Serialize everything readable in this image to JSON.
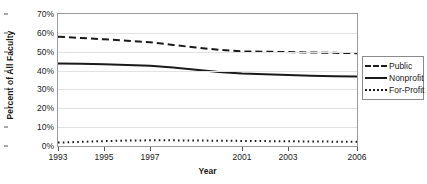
{
  "chart_data": {
    "type": "line",
    "title": "",
    "xlabel": "Year",
    "ylabel": "Percent of All Faculty",
    "xlim": [
      1993,
      2006
    ],
    "ylim": [
      0,
      70
    ],
    "grid": true,
    "legend_position": "right-outside",
    "x": [
      1993,
      1994,
      1995,
      1996,
      1997,
      1998,
      1999,
      2000,
      2001,
      2002,
      2003,
      2004,
      2005,
      2006
    ],
    "xtick_labels": [
      "1993",
      "1995",
      "1997",
      "2001",
      "2003",
      "2006"
    ],
    "xtick_values": [
      1993,
      1995,
      1997,
      2001,
      2003,
      2006
    ],
    "ytick_labels": [
      "0%",
      "10%",
      "20%",
      "30%",
      "40%",
      "50%",
      "60%",
      "70%"
    ],
    "ytick_values": [
      0,
      10,
      20,
      30,
      40,
      50,
      60,
      70
    ],
    "series": [
      {
        "name": "Public",
        "style": "dashed",
        "color": "#1a1a1a",
        "values": [
          58.0,
          57.3,
          56.6,
          55.8,
          55.0,
          53.6,
          52.2,
          51.0,
          50.2,
          50.0,
          49.8,
          49.6,
          49.4,
          49.2
        ]
      },
      {
        "name": "Nonprofit",
        "style": "solid",
        "color": "#1a1a1a",
        "values": [
          43.8,
          43.6,
          43.3,
          43.0,
          42.6,
          41.6,
          40.4,
          39.2,
          38.4,
          38.0,
          37.6,
          37.3,
          37.0,
          36.8
        ]
      },
      {
        "name": "For-Profit",
        "style": "dotted",
        "color": "#1a1a1a",
        "values": [
          1.8,
          2.2,
          2.6,
          2.9,
          3.0,
          3.0,
          2.9,
          2.8,
          2.7,
          2.6,
          2.5,
          2.4,
          2.3,
          2.2
        ]
      }
    ]
  },
  "legend": {
    "items": [
      {
        "label": "Public",
        "style": "dashed"
      },
      {
        "label": "Nonprofit",
        "style": "solid"
      },
      {
        "label": "For-Profit",
        "style": "dotted"
      }
    ]
  }
}
